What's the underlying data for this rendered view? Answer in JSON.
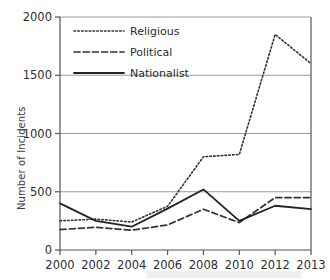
{
  "chart_data": {
    "type": "line",
    "title": "",
    "xlabel": "",
    "ylabel": "Number of Incidents",
    "categories": [
      "2000",
      "2002",
      "2004",
      "2006",
      "2008",
      "2010",
      "2012",
      "2013"
    ],
    "ylim": [
      0,
      2000
    ],
    "yticks": [
      0,
      500,
      1000,
      1500,
      2000
    ],
    "ytick_labels": [
      "0",
      "500",
      "1000",
      "1500",
      "2000"
    ],
    "grid": true,
    "grid_axis": "y",
    "legend_position": "upper left",
    "series": [
      {
        "name": "Religious",
        "style": "dotted",
        "color": "#333333",
        "values": [
          250,
          265,
          240,
          375,
          800,
          820,
          1850,
          1600
        ]
      },
      {
        "name": "Political",
        "style": "dashed",
        "color": "#333333",
        "values": [
          175,
          195,
          170,
          215,
          350,
          235,
          450,
          450
        ]
      },
      {
        "name": "Nationalist",
        "style": "solid",
        "color": "#222222",
        "values": [
          400,
          250,
          200,
          355,
          520,
          250,
          380,
          350
        ]
      }
    ]
  },
  "axis": {
    "ylabel": "Number of Incidents"
  }
}
